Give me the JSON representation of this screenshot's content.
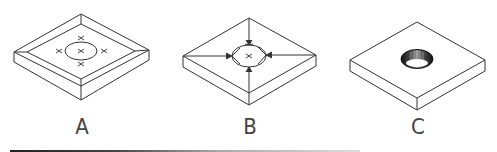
{
  "figures": [
    {
      "id": "A",
      "label": "A",
      "description": "Square tray with raised walls; top surface with circle and x markers"
    },
    {
      "id": "B",
      "label": "B",
      "description": "Square slab with lines from corners converging to a central circle with arrows"
    },
    {
      "id": "C",
      "label": "C",
      "description": "Square slab with a threaded hole through center"
    }
  ],
  "colors": {
    "stroke": "#333333",
    "hole_dark": "#1a1a1a",
    "background": "#ffffff"
  }
}
